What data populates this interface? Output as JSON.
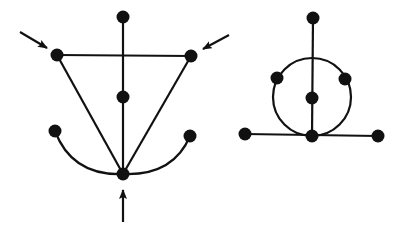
{
  "figure": {
    "stroke_color": "#111111",
    "node_color": "#111111",
    "background": "#ffffff"
  },
  "graphs": [
    {
      "id": "left-graph",
      "nodes": [
        {
          "id": "top",
          "x": 123,
          "y": 17
        },
        {
          "id": "upper-left",
          "x": 57,
          "y": 55
        },
        {
          "id": "upper-right",
          "x": 191,
          "y": 56
        },
        {
          "id": "center",
          "x": 123,
          "y": 97
        },
        {
          "id": "lower-left",
          "x": 55,
          "y": 131
        },
        {
          "id": "lower-right",
          "x": 190,
          "y": 136
        },
        {
          "id": "bottom",
          "x": 123,
          "y": 174
        }
      ],
      "edges": [
        {
          "from": "top",
          "to": "bottom",
          "type": "line"
        },
        {
          "from": "upper-left",
          "to": "upper-right",
          "type": "line"
        },
        {
          "from": "upper-left",
          "to": "bottom",
          "type": "line"
        },
        {
          "from": "upper-right",
          "to": "bottom",
          "type": "line"
        },
        {
          "from": "lower-left",
          "to": "bottom",
          "type": "curve"
        },
        {
          "from": "lower-right",
          "to": "bottom",
          "type": "curve"
        }
      ],
      "arrows": [
        {
          "id": "arrow-upper-left",
          "x1": 20,
          "y1": 32,
          "x2": 47,
          "y2": 48
        },
        {
          "id": "arrow-upper-right",
          "x1": 229,
          "y1": 35,
          "x2": 203,
          "y2": 49
        },
        {
          "id": "arrow-bottom",
          "x1": 123,
          "y1": 222,
          "x2": 123,
          "y2": 190
        }
      ]
    },
    {
      "id": "right-graph",
      "circle": {
        "cx": 312,
        "cy": 97,
        "r": 39
      },
      "nodes": [
        {
          "id": "top",
          "x": 313,
          "y": 18
        },
        {
          "id": "circle-left",
          "x": 277,
          "y": 78
        },
        {
          "id": "circle-right",
          "x": 345,
          "y": 79
        },
        {
          "id": "center",
          "x": 312,
          "y": 98
        },
        {
          "id": "bottom",
          "x": 312,
          "y": 136
        },
        {
          "id": "far-left",
          "x": 245,
          "y": 134
        },
        {
          "id": "far-right",
          "x": 378,
          "y": 136
        }
      ],
      "edges": [
        {
          "from": "top",
          "to": "bottom",
          "type": "line"
        },
        {
          "from": "far-left",
          "to": "far-right",
          "type": "line"
        }
      ]
    }
  ]
}
